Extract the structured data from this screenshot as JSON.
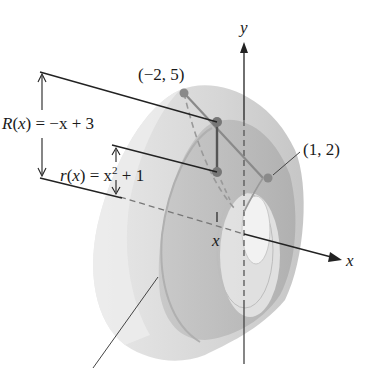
{
  "figure": {
    "labels": {
      "outer_radius": "R(x) = −x + 3",
      "outer_radius_parts": {
        "fn": "R",
        "arg": "x",
        "rhs": " = −x + 3"
      },
      "inner_radius": "r(x) = x² + 1",
      "inner_radius_parts": {
        "fn": "r",
        "arg": "x",
        "rhs_a": " = x",
        "sup": "2",
        "rhs_b": " + 1"
      },
      "point_top": "(−2, 5)",
      "point_right": "(1, 2)",
      "x_tick": "x",
      "x_axis": "x",
      "y_axis": "y"
    },
    "colors": {
      "outer_solid": "#cfcfcf",
      "outer_solid_light": "#e2e2e2",
      "inner_band": "#b4b4b4",
      "hole": "#eeeeee",
      "point": "#8a8a8a",
      "line": "#222222",
      "dash": "#777777"
    }
  }
}
